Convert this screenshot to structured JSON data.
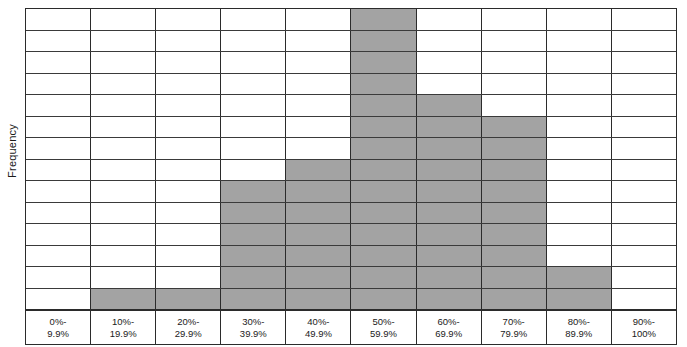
{
  "chart": {
    "title": "",
    "y_axis_label": "Frequency",
    "x_axis_label": ""
  },
  "chart_data": {
    "type": "bar",
    "title": "",
    "xlabel": "",
    "ylabel": "Frequency",
    "ylim": [
      0,
      14
    ],
    "grid": true,
    "gridlines": 14,
    "legend": "none",
    "bar_color": "#a3a3a3",
    "border_color": "#2b2b2b",
    "categories": [
      "0%-9.9%",
      "10%-19.9%",
      "20%-29.9%",
      "30%-39.9%",
      "40%-49.9%",
      "50%-59.9%",
      "60%-69.9%",
      "70%-79.9%",
      "80%-89.9%",
      "90%-100%"
    ],
    "category_lines": [
      [
        "0%-",
        "9.9%"
      ],
      [
        "10%-",
        "19.9%"
      ],
      [
        "20%-",
        "29.9%"
      ],
      [
        "30%-",
        "39.9%"
      ],
      [
        "40%-",
        "49.9%"
      ],
      [
        "50%-",
        "59.9%"
      ],
      [
        "60%-",
        "69.9%"
      ],
      [
        "70%-",
        "79.9%"
      ],
      [
        "80%-",
        "89.9%"
      ],
      [
        "90%-",
        "100%"
      ]
    ],
    "values": [
      0,
      1,
      1,
      6,
      7,
      14,
      10,
      9,
      2,
      0
    ]
  }
}
